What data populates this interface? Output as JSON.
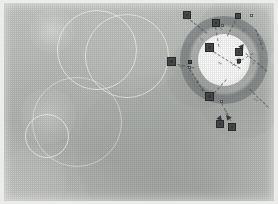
{
  "image": {
    "title": "Annotated field visualization",
    "medium": "grayscale raster with vector annotation overlay",
    "width_px": 278,
    "height_px": 204,
    "frame_color": "#ececeb",
    "canvas_background": "#b9bcb8"
  },
  "palette": {
    "matte": "#ececeb",
    "field_light": "#c6c9c5",
    "field_mid": "#b4b7b3",
    "field_dark": "#a4a7a3",
    "core_white": "#ffffff",
    "halo_gray": "#6e7274",
    "marker_fill": "#4a4b4c",
    "marker_inner": "#5d5e60",
    "marker_stroke": "#2c2d2e",
    "ring_stroke": "#ffffff",
    "leader_stroke": "#46484a",
    "label_text": "#3a3c3e"
  },
  "core": {
    "label": "bright core",
    "center_x": 220,
    "center_y": 57,
    "radius": 26,
    "halo_radius": 44
  },
  "blobs": [
    {
      "name": "blob-top-left-small",
      "cx": 48,
      "cy": 28,
      "r": 22,
      "color": "rgba(226,228,224,0.72)",
      "softness": 0.52
    },
    {
      "name": "blob-left-mid",
      "cx": 44,
      "cy": 113,
      "r": 28,
      "color": "rgba(214,217,213,0.62)",
      "softness": 0.55
    },
    {
      "name": "blob-center-large",
      "cx": 150,
      "cy": 150,
      "r": 78,
      "color": "rgba(168,172,168,0.50)",
      "softness": 0.7
    },
    {
      "name": "blob-upper-center",
      "cx": 128,
      "cy": 40,
      "r": 52,
      "color": "rgba(198,201,197,0.45)",
      "softness": 0.72
    },
    {
      "name": "blob-right-upper",
      "cx": 232,
      "cy": 35,
      "r": 40,
      "color": "rgba(150,154,152,0.48)",
      "softness": 0.62
    },
    {
      "name": "blob-right-lower",
      "cx": 238,
      "cy": 92,
      "r": 44,
      "color": "rgba(158,162,160,0.45)",
      "softness": 0.66
    },
    {
      "name": "blob-mid-right",
      "cx": 196,
      "cy": 72,
      "r": 34,
      "color": "rgba(146,150,148,0.42)",
      "softness": 0.6
    },
    {
      "name": "blob-bottom-left",
      "cx": 28,
      "cy": 178,
      "r": 34,
      "color": "rgba(200,203,199,0.40)",
      "softness": 0.7
    },
    {
      "name": "blob-top-right-corner",
      "cx": 262,
      "cy": 10,
      "r": 26,
      "color": "rgba(206,209,205,0.40)",
      "softness": 0.7
    }
  ],
  "rings": [
    {
      "name": "ring-upper-left-large",
      "cx": 92,
      "cy": 46,
      "r": 39,
      "opacity": 0.7
    },
    {
      "name": "ring-upper-right-large",
      "cx": 122,
      "cy": 52,
      "r": 41,
      "opacity": 0.66
    },
    {
      "name": "ring-lower-left-small",
      "cx": 42,
      "cy": 132,
      "r": 21,
      "opacity": 0.72
    },
    {
      "name": "ring-lower-left-wide",
      "cx": 72,
      "cy": 118,
      "r": 44,
      "opacity": 0.48
    }
  ],
  "markers": [
    {
      "name": "marker-01",
      "x": 179,
      "y": 8,
      "size": 8,
      "style": "solid"
    },
    {
      "name": "marker-02",
      "x": 231,
      "y": 10,
      "size": 6,
      "style": "solid"
    },
    {
      "name": "marker-03",
      "x": 208,
      "y": 16,
      "size": 8,
      "style": "solid"
    },
    {
      "name": "marker-04",
      "x": 201,
      "y": 40,
      "size": 9,
      "style": "solid"
    },
    {
      "name": "marker-05",
      "x": 231,
      "y": 45,
      "size": 8,
      "style": "solid"
    },
    {
      "name": "marker-06",
      "x": 163,
      "y": 54,
      "size": 9,
      "style": "solid"
    },
    {
      "name": "marker-07",
      "x": 201,
      "y": 89,
      "size": 9,
      "style": "solid"
    },
    {
      "name": "marker-08",
      "x": 212,
      "y": 117,
      "size": 8,
      "style": "solid"
    },
    {
      "name": "marker-09",
      "x": 224,
      "y": 120,
      "size": 8,
      "style": "solid"
    },
    {
      "name": "marker-10",
      "x": 184,
      "y": 57,
      "size": 4,
      "style": "small"
    },
    {
      "name": "marker-11",
      "x": 233,
      "y": 56,
      "size": 4,
      "style": "small"
    }
  ],
  "ticks": [
    {
      "name": "tick-a",
      "x": 217,
      "y": 21
    },
    {
      "name": "tick-b",
      "x": 184,
      "y": 63
    },
    {
      "name": "tick-c",
      "x": 233,
      "y": 58
    },
    {
      "name": "tick-d",
      "x": 216,
      "y": 97
    },
    {
      "name": "tick-e",
      "x": 246,
      "y": 11
    }
  ],
  "triangles": [
    {
      "name": "triangle-a",
      "x": 235,
      "y": 42,
      "rotate": 155
    },
    {
      "name": "triangle-b",
      "x": 213,
      "y": 112,
      "rotate": 20
    },
    {
      "name": "triangle-c",
      "x": 221,
      "y": 113,
      "rotate": 200
    }
  ],
  "leaders": [
    {
      "name": "leader-01",
      "x": 183,
      "y": 14,
      "length": 26,
      "angle": 38
    },
    {
      "name": "leader-02",
      "x": 212,
      "y": 24,
      "length": 20,
      "angle": 80
    },
    {
      "name": "leader-03",
      "x": 234,
      "y": 14,
      "length": 22,
      "angle": 118
    },
    {
      "name": "leader-04",
      "x": 206,
      "y": 46,
      "length": 36,
      "angle": 32
    },
    {
      "name": "leader-05",
      "x": 169,
      "y": 60,
      "length": 22,
      "angle": 12
    },
    {
      "name": "leader-06",
      "x": 186,
      "y": 66,
      "length": 26,
      "angle": 58
    },
    {
      "name": "leader-07",
      "x": 206,
      "y": 94,
      "length": 24,
      "angle": -48
    },
    {
      "name": "leader-08",
      "x": 218,
      "y": 100,
      "length": 20,
      "angle": 62
    },
    {
      "name": "leader-09",
      "x": 242,
      "y": 50,
      "length": 28,
      "angle": 40
    },
    {
      "name": "leader-10",
      "x": 246,
      "y": 86,
      "length": 26,
      "angle": 44
    },
    {
      "name": "leader-11",
      "x": 228,
      "y": 62,
      "length": 24,
      "angle": -30
    },
    {
      "name": "leader-12",
      "x": 252,
      "y": 26,
      "length": 22,
      "angle": 70
    }
  ],
  "labels": [
    {
      "name": "label-01",
      "text": "a1",
      "x": 196,
      "y": 34,
      "rotate": 38
    },
    {
      "name": "label-02",
      "text": "b2",
      "x": 216,
      "y": 22,
      "rotate": 80
    },
    {
      "name": "label-03",
      "text": "c3",
      "x": 240,
      "y": 24,
      "rotate": 118
    },
    {
      "name": "label-04",
      "text": "d4",
      "x": 214,
      "y": 58,
      "rotate": 34
    },
    {
      "name": "label-05",
      "text": "e5",
      "x": 175,
      "y": 62,
      "rotate": 12
    },
    {
      "name": "label-06",
      "text": "f6",
      "x": 192,
      "y": 76,
      "rotate": 58
    },
    {
      "name": "label-07",
      "text": "g7",
      "x": 198,
      "y": 86,
      "rotate": -48
    },
    {
      "name": "label-08",
      "text": "h8",
      "x": 221,
      "y": 107,
      "rotate": 62
    },
    {
      "name": "label-09",
      "text": "i9",
      "x": 248,
      "y": 58,
      "rotate": 42
    },
    {
      "name": "label-10",
      "text": "j10",
      "x": 250,
      "y": 94,
      "rotate": 44
    },
    {
      "name": "label-11",
      "text": "k11",
      "x": 232,
      "y": 56,
      "rotate": -30
    },
    {
      "name": "label-12",
      "text": "l12",
      "x": 256,
      "y": 36,
      "rotate": 70
    }
  ]
}
